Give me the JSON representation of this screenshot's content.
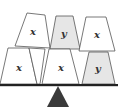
{
  "diagram": {
    "colors": {
      "block_plain": "#ffffff",
      "block_shaded": "#e6e6e6",
      "outline": "#555555",
      "beam": "#222222",
      "fulcrum": "#3a3a3a",
      "label": "#333333"
    },
    "blocks": {
      "top": [
        {
          "label": "x",
          "shaded": false
        },
        {
          "label": "y",
          "shaded": true
        },
        {
          "label": "x",
          "shaded": false
        }
      ],
      "bottom": [
        {
          "label": "x",
          "shaded": false
        },
        {
          "label": "x",
          "shaded": false
        },
        {
          "label": "y",
          "shaded": true
        }
      ]
    }
  }
}
